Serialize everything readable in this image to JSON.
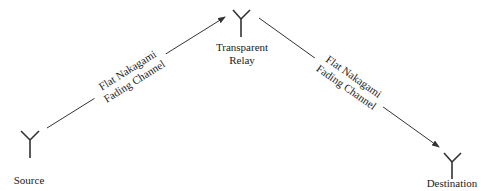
{
  "diagram": {
    "nodes": [
      {
        "id": "source",
        "label_lines": [
          "Source"
        ],
        "icon": "antenna-icon"
      },
      {
        "id": "relay",
        "label_lines": [
          "Transparent",
          "Relay"
        ],
        "icon": "antenna-icon"
      },
      {
        "id": "destination",
        "label_lines": [
          "Destination"
        ],
        "icon": "antenna-icon"
      }
    ],
    "links": [
      {
        "from": "source",
        "to": "relay",
        "label_lines": [
          "Flat Nakagami",
          "Fading Channel"
        ]
      },
      {
        "from": "relay",
        "to": "destination",
        "label_lines": [
          "Flat Nakagami",
          "Fading Channel"
        ]
      }
    ],
    "colors": {
      "stroke": "#333333",
      "text": "#222222",
      "background": "#ffffff"
    }
  }
}
